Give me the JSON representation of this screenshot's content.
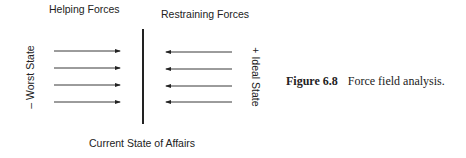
{
  "figure": {
    "helping_title": "Helping Forces",
    "restraining_title": "Restraining Forces",
    "left_pole": "– Worst State",
    "right_pole": "+ Ideal State",
    "bottom_label": "Current State of Affairs",
    "helping_arrows": [
      {
        "y": 51,
        "x1": 54,
        "x2": 120,
        "direction": "right"
      },
      {
        "y": 68,
        "x1": 54,
        "x2": 120,
        "direction": "right"
      },
      {
        "y": 85,
        "x1": 54,
        "x2": 120,
        "direction": "right"
      },
      {
        "y": 102,
        "x1": 54,
        "x2": 120,
        "direction": "right"
      }
    ],
    "restraining_arrows": [
      {
        "y": 52,
        "x1": 232,
        "x2": 166,
        "direction": "left"
      },
      {
        "y": 69,
        "x1": 232,
        "x2": 166,
        "direction": "left"
      },
      {
        "y": 86,
        "x1": 232,
        "x2": 166,
        "direction": "left"
      },
      {
        "y": 102,
        "x1": 232,
        "x2": 166,
        "direction": "left"
      }
    ],
    "line_color": "#222222"
  },
  "caption": {
    "number": "Figure 6.8",
    "text": "Force field analysis."
  }
}
